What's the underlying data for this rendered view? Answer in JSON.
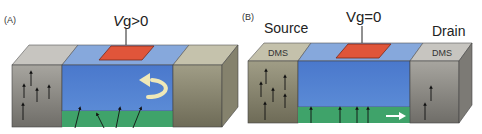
{
  "colors": {
    "semiconductor": "#4f7fcf",
    "semiconductor_top": "#7fa5dc",
    "channel": "#3fa36a",
    "gate": "#e0553a",
    "metal_gray_front": "#8f8d88",
    "metal_gray_top": "#c4c2bd",
    "metal_olive_front": "#8e8b74",
    "metal_olive_top": "#c5c2ac",
    "arrow": "#111111",
    "reflection_arrow": "#efe8b8",
    "flow_arrow": "#ffffff"
  },
  "panels": [
    {
      "id": "A",
      "label": "(A)",
      "gate_voltage_prefix": "V",
      "gate_voltage_suffix": "g>0",
      "source_label": "",
      "drain_label": "",
      "source_top_text": "",
      "drain_top_text": "",
      "channel_spin_state": "rotated spins (scattered)",
      "carrier_behavior": "reflected"
    },
    {
      "id": "B",
      "label": "(B)",
      "gate_voltage_prefix": "",
      "gate_voltage_suffix": "Vg=0",
      "source_label": "Source",
      "drain_label": "Drain",
      "source_top_text": "DMS",
      "drain_top_text": "DMS",
      "channel_spin_state": "aligned spins",
      "carrier_behavior": "transmitted"
    }
  ]
}
